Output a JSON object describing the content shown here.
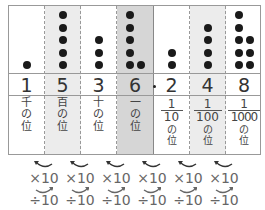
{
  "diagram": {
    "columns": [
      {
        "digit": "1",
        "dots": 1,
        "label": [
          "千",
          "の",
          "位"
        ],
        "shade": "none"
      },
      {
        "digit": "5",
        "dots": 5,
        "label": [
          "百",
          "の",
          "位"
        ],
        "shade": "light"
      },
      {
        "digit": "3",
        "dots": 3,
        "label": [
          "十",
          "の",
          "位"
        ],
        "shade": "none"
      },
      {
        "digit": "6",
        "dots": 6,
        "label": [
          "一",
          "の",
          "位"
        ],
        "shade": "dark"
      },
      {
        "digit": "2",
        "dots": 2,
        "fraction": {
          "numerator": "1",
          "denominator": "10"
        },
        "label": [
          "の",
          "位"
        ],
        "shade": "none"
      },
      {
        "digit": "4",
        "dots": 4,
        "fraction": {
          "numerator": "1",
          "denominator": "100"
        },
        "label": [
          "の",
          "位"
        ],
        "shade": "light"
      },
      {
        "digit": "8",
        "dots": 8,
        "fraction": {
          "numerator": "1",
          "denominator": "1000"
        },
        "label": [
          "の",
          "位"
        ],
        "shade": "none"
      }
    ],
    "decimal_point": ".",
    "operations": {
      "multiply": [
        "×10",
        "×10",
        "×10",
        "×10",
        "×10",
        "×10"
      ],
      "divide": [
        "÷10",
        "÷10",
        "÷10",
        "÷10",
        "÷10",
        "÷10"
      ]
    },
    "colors": {
      "dot": "#1a1a1a",
      "shade_light": "#ececec",
      "shade_dark": "#d6d6d6",
      "arrow": "#333333"
    }
  }
}
